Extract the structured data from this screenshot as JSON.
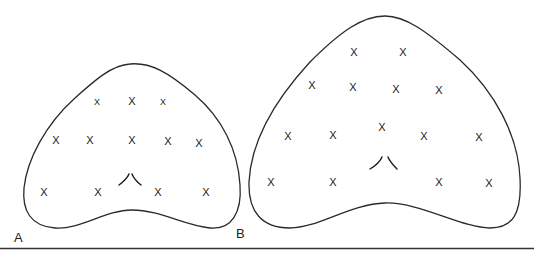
{
  "figure": {
    "panels": [
      {
        "label": "A",
        "marker": "X",
        "marks": [
          {
            "x": 97,
            "y": 102,
            "size": 9
          },
          {
            "x": 132,
            "y": 101,
            "size": 11
          },
          {
            "x": 163,
            "y": 102,
            "size": 9
          },
          {
            "x": 56,
            "y": 140,
            "size": 11
          },
          {
            "x": 90,
            "y": 140,
            "size": 11
          },
          {
            "x": 132,
            "y": 140,
            "size": 11
          },
          {
            "x": 168,
            "y": 141,
            "size": 11
          },
          {
            "x": 199,
            "y": 143,
            "size": 11
          },
          {
            "x": 44,
            "y": 192,
            "size": 11
          },
          {
            "x": 98,
            "y": 192,
            "size": 11
          },
          {
            "x": 158,
            "y": 192,
            "size": 11
          },
          {
            "x": 206,
            "y": 192,
            "size": 11
          }
        ]
      },
      {
        "label": "B",
        "marker": "X",
        "marks": [
          {
            "x": 354,
            "y": 52,
            "size": 11
          },
          {
            "x": 403,
            "y": 52,
            "size": 11
          },
          {
            "x": 312,
            "y": 85,
            "size": 11
          },
          {
            "x": 353,
            "y": 87,
            "size": 11
          },
          {
            "x": 396,
            "y": 89,
            "size": 11
          },
          {
            "x": 439,
            "y": 90,
            "size": 11
          },
          {
            "x": 288,
            "y": 136,
            "size": 11
          },
          {
            "x": 333,
            "y": 135,
            "size": 11
          },
          {
            "x": 382,
            "y": 127,
            "size": 11
          },
          {
            "x": 424,
            "y": 136,
            "size": 11
          },
          {
            "x": 479,
            "y": 137,
            "size": 11
          },
          {
            "x": 271,
            "y": 182,
            "size": 11
          },
          {
            "x": 333,
            "y": 182,
            "size": 11
          },
          {
            "x": 439,
            "y": 182,
            "size": 11
          },
          {
            "x": 489,
            "y": 183,
            "size": 11
          }
        ]
      }
    ]
  }
}
